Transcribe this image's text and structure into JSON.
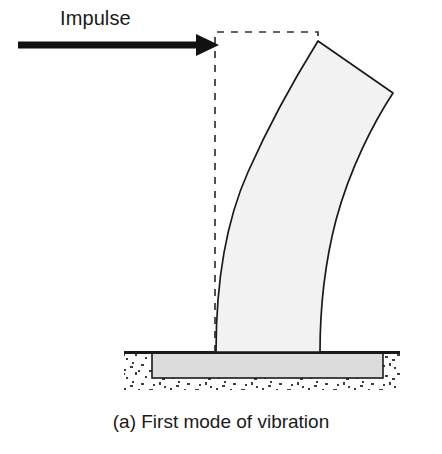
{
  "figure": {
    "caption": "(a) First mode of vibration",
    "impulse_label": "Impulse"
  },
  "annotations": {
    "impulse_arrow": "impulse-arrow",
    "undeformed_outline": "undeformed-column-outline",
    "deformed_column": "deformed-column-shape",
    "foundation": "foundation-block",
    "ground_line": "ground-surface-line",
    "soil": "soil-hatching"
  },
  "colors": {
    "stroke": "#1a1a1a",
    "column_fill": "#f2f2f2",
    "foundation_fill": "#dcdcdc",
    "background": "#ffffff",
    "soil_speckle": "#3d3d3d"
  },
  "geometry": {
    "arrow": {
      "shaft_x_start": 18,
      "shaft_x_end": 198,
      "tip_x": 219,
      "y": 45,
      "shaft_thickness": 7,
      "head_height": 22
    },
    "undeformed_rect": {
      "x": 215,
      "y": 32,
      "width": 103,
      "height": 320,
      "dash": "7 7"
    },
    "deformed_column": {
      "base_left_x": 216,
      "base_right_x": 320,
      "base_y": 352,
      "top_left_x": 318,
      "top_left_y": 41,
      "tip_x": 393,
      "tip_y": 93,
      "description": "cantilever bent to the right, fixed at base, free at top"
    },
    "foundation": {
      "x": 152,
      "y": 353,
      "width": 231,
      "height": 25
    },
    "ground_line": {
      "x_start": 124,
      "x_end": 400,
      "y": 352,
      "thickness": 3
    },
    "soil_region": {
      "x": 124,
      "y": 352,
      "width": 276,
      "height": 38
    }
  }
}
